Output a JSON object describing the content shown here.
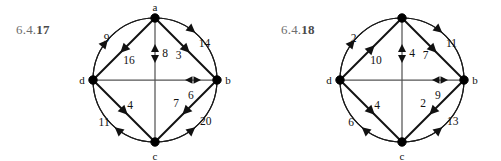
{
  "page": {
    "background_color": "#ffffff",
    "ink_color": "#111111",
    "label_color": "#6e6e6e"
  },
  "figures": [
    {
      "id": "6.4.17",
      "number_prefix": "6.4.",
      "number_id": "17",
      "vertices": [
        {
          "name": "a",
          "label": "a",
          "position": "top"
        },
        {
          "name": "b",
          "label": "b",
          "position": "right"
        },
        {
          "name": "c",
          "label": "c",
          "position": "bottom"
        },
        {
          "name": "d",
          "label": "d",
          "position": "left"
        }
      ],
      "edges": [
        {
          "name": "arc-d-a",
          "from": "d",
          "to": "a",
          "weight": "9",
          "kind": "arc",
          "side": "top-left",
          "direction": "d-to-a"
        },
        {
          "name": "chord-a-d",
          "from": "a",
          "to": "d",
          "weight": "16",
          "kind": "chord",
          "side": "top-left",
          "direction": "a-to-d"
        },
        {
          "name": "chord-a-c",
          "from": "a",
          "to": "c",
          "weight": "8",
          "kind": "chord",
          "side": "vertical",
          "direction": "both"
        },
        {
          "name": "chord-a-b",
          "from": "a",
          "to": "b",
          "weight": "3",
          "kind": "chord",
          "side": "top-right",
          "direction": "a-to-b"
        },
        {
          "name": "arc-a-b",
          "from": "a",
          "to": "b",
          "weight": "14",
          "kind": "arc",
          "side": "top-right",
          "direction": "a-to-b"
        },
        {
          "name": "chord-d-b",
          "from": "d",
          "to": "b",
          "weight": "6",
          "kind": "chord",
          "side": "horizontal",
          "direction": "both"
        },
        {
          "name": "chord-d-c",
          "from": "d",
          "to": "c",
          "weight": "4",
          "kind": "chord",
          "side": "bottom-left",
          "direction": "d-to-c"
        },
        {
          "name": "arc-c-d",
          "from": "c",
          "to": "d",
          "weight": "11",
          "kind": "arc",
          "side": "bottom-left",
          "direction": "c-to-d"
        },
        {
          "name": "chord-b-c",
          "from": "b",
          "to": "c",
          "weight": "7",
          "kind": "chord",
          "side": "bottom-right",
          "direction": "b-to-c"
        },
        {
          "name": "arc-c-b",
          "from": "c",
          "to": "b",
          "weight": "20",
          "kind": "arc",
          "side": "bottom-right",
          "direction": "c-to-b"
        }
      ]
    },
    {
      "id": "6.4.18",
      "number_prefix": "6.4.",
      "number_id": "18",
      "vertices": [
        {
          "name": "a",
          "label": "",
          "position": "top"
        },
        {
          "name": "b",
          "label": "b",
          "position": "right"
        },
        {
          "name": "c",
          "label": "c",
          "position": "bottom"
        },
        {
          "name": "d",
          "label": "d",
          "position": "left"
        }
      ],
      "edges": [
        {
          "name": "arc-d-a",
          "from": "d",
          "to": "a",
          "weight": "2",
          "kind": "arc",
          "side": "top-left",
          "direction": "d-to-a"
        },
        {
          "name": "chord-d-a",
          "from": "d",
          "to": "a",
          "weight": "10",
          "kind": "chord",
          "side": "top-left",
          "direction": "d-to-a"
        },
        {
          "name": "chord-a-c",
          "from": "a",
          "to": "c",
          "weight": "4",
          "kind": "chord",
          "side": "vertical",
          "direction": "both"
        },
        {
          "name": "chord-a-b",
          "from": "a",
          "to": "b",
          "weight": "7",
          "kind": "chord",
          "side": "top-right",
          "direction": "a-to-b"
        },
        {
          "name": "arc-a-b",
          "from": "a",
          "to": "b",
          "weight": "11",
          "kind": "arc",
          "side": "top-right",
          "direction": "a-to-b"
        },
        {
          "name": "chord-d-b",
          "from": "d",
          "to": "b",
          "weight": "9",
          "kind": "chord",
          "side": "horizontal",
          "direction": "both"
        },
        {
          "name": "chord-d-c",
          "from": "d",
          "to": "c",
          "weight": "4",
          "kind": "chord",
          "side": "bottom-left",
          "direction": "d-to-c"
        },
        {
          "name": "arc-c-d",
          "from": "c",
          "to": "d",
          "weight": "6",
          "kind": "arc",
          "side": "bottom-left",
          "direction": "c-to-d"
        },
        {
          "name": "chord-b-c",
          "from": "b",
          "to": "c",
          "weight": "2",
          "kind": "chord",
          "side": "bottom-right",
          "direction": "b-to-c"
        },
        {
          "name": "arc-c-b",
          "from": "c",
          "to": "b",
          "weight": "13",
          "kind": "arc",
          "side": "bottom-right",
          "direction": "c-to-b"
        }
      ]
    }
  ]
}
